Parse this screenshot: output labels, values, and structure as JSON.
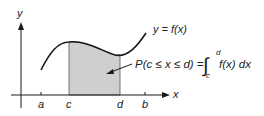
{
  "diagram": {
    "axes": {
      "x_label": "x",
      "y_label": "y"
    },
    "ticks": [
      {
        "id": "a",
        "label": "a"
      },
      {
        "id": "c",
        "label": "c"
      },
      {
        "id": "d",
        "label": "d"
      },
      {
        "id": "b",
        "label": "b"
      }
    ],
    "curve_label": "y = f(x)",
    "formula": {
      "lhs": "P(c ≤ x ≤ d) =",
      "integral_sign": "∫",
      "upper_limit": "d",
      "lower_limit": "c",
      "integrand": "f(x) dx"
    },
    "colors": {
      "shaded_region": "#cfcfcf",
      "stroke": "#1a1a1a"
    }
  }
}
